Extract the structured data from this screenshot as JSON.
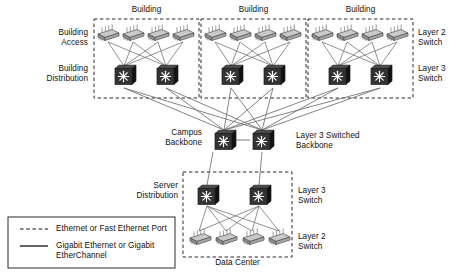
{
  "diagram": {
    "background": "#ffffff",
    "line_color": "#6e6e6e",
    "box_border_color": "#2b2b2b",
    "l3_body_color": "#2f2f2f",
    "l3_side_color": "#141414",
    "l2_body_color": "#9a9a9a",
    "l2_top_color": "#c8c8c8"
  },
  "groups": {
    "building_1_label": "Building",
    "building_2_label": "Building",
    "building_3_label": "Building",
    "data_center_label": "Data Center"
  },
  "tier_labels": {
    "building_access": "Building\nAccess",
    "building_distribution": "Building\nDistribution",
    "campus_backbone": "Campus\nBackbone",
    "server_distribution": "Server\nDistribution"
  },
  "right_labels": {
    "layer2_top": "Layer 2\nSwitch",
    "layer3_top": "Layer 3\nSwitch",
    "backbone": "Layer 3 Switched\nBackbone",
    "layer3_dc": "Layer 3\nSwitch",
    "layer2_dc": "Layer 2\nSwitch"
  },
  "legend": {
    "items": [
      {
        "style": "dashed",
        "label": "Ethernet or Fast Ethernet Port"
      },
      {
        "style": "solid",
        "label": "Gigabit Ethernet or Gigabit\nEtherChannel"
      }
    ]
  },
  "nodes": {
    "building1_access": [
      "access-switch",
      "access-switch",
      "access-switch",
      "access-switch"
    ],
    "building1_distribution": [
      "layer3-switch",
      "layer3-switch"
    ],
    "building2_access": [
      "access-switch",
      "access-switch",
      "access-switch",
      "access-switch"
    ],
    "building2_distribution": [
      "layer3-switch",
      "layer3-switch"
    ],
    "building3_access": [
      "access-switch",
      "access-switch",
      "access-switch",
      "access-switch"
    ],
    "building3_distribution": [
      "layer3-switch",
      "layer3-switch"
    ],
    "campus_backbone": [
      "layer3-switch",
      "layer3-switch"
    ],
    "server_distribution": [
      "layer3-switch",
      "layer3-switch"
    ],
    "data_center_access": [
      "access-switch",
      "access-switch",
      "access-switch",
      "access-switch"
    ]
  }
}
